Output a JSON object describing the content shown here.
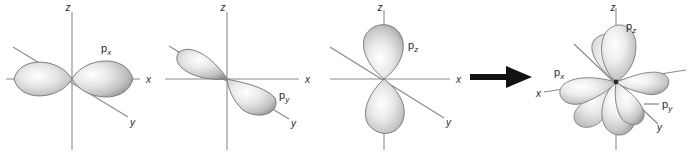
{
  "figure": {
    "background_color": "#ffffff",
    "axis_color": "#6b6b6b",
    "lobe_edge_color": "#6e6e6e",
    "lobe_light_color": "#ffffff",
    "lobe_mid_color": "#cfcfcf",
    "lobe_dark_color": "#8a8a8a",
    "arrow_color": "#111111",
    "label_color": "#2b2b2b"
  },
  "panels": [
    {
      "id": "px-panel",
      "name": "p-x-orbital-panel",
      "orbital_label": "p",
      "orbital_subscript": "x",
      "axes": [
        {
          "name": "z",
          "label": "z"
        },
        {
          "name": "x",
          "label": "x"
        },
        {
          "name": "y",
          "label": "y"
        }
      ],
      "lobe_count": 2,
      "lobe_orientation": "along-x-axis-horizontal"
    },
    {
      "id": "py-panel",
      "name": "p-y-orbital-panel",
      "orbital_label": "p",
      "orbital_subscript": "y",
      "axes": [
        {
          "name": "z",
          "label": "z"
        },
        {
          "name": "x",
          "label": "x"
        },
        {
          "name": "y",
          "label": "y"
        }
      ],
      "lobe_count": 2,
      "lobe_orientation": "along-y-axis-diagonal"
    },
    {
      "id": "pz-panel",
      "name": "p-z-orbital-panel",
      "orbital_label": "p",
      "orbital_subscript": "z",
      "axes": [
        {
          "name": "z",
          "label": "z"
        },
        {
          "name": "x",
          "label": "x"
        },
        {
          "name": "y",
          "label": "y"
        }
      ],
      "lobe_count": 2,
      "lobe_orientation": "along-z-axis-vertical"
    },
    {
      "id": "combined-panel",
      "name": "combined-p-orbitals-panel",
      "axes": [
        {
          "name": "z",
          "label": "z"
        },
        {
          "name": "x",
          "label": "x"
        },
        {
          "name": "y",
          "label": "y"
        }
      ],
      "lobe_count": 6,
      "lobe_orientation": "all-three-axes-superimposed",
      "labels": [
        {
          "name": "pz",
          "label": "p",
          "subscript": "z"
        },
        {
          "name": "px",
          "label": "p",
          "subscript": "x"
        },
        {
          "name": "py",
          "label": "p",
          "subscript": "y"
        }
      ]
    }
  ],
  "arrow": {
    "name": "combination-arrow",
    "direction": "right",
    "label": ""
  }
}
